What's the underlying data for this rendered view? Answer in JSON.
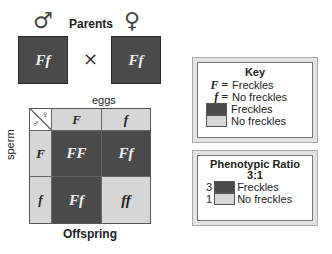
{
  "parents": {
    "title": "Parents",
    "male_symbol": "♂",
    "female_symbol": "♀",
    "male_genotype": "Ff",
    "female_genotype": "Ff",
    "cross_symbol": "×"
  },
  "punnett": {
    "top_label": "eggs",
    "side_label": "sperm",
    "bottom_label": "Offspring",
    "corner_male": "♂",
    "corner_female": "♀",
    "egg_alleles": [
      "F",
      "f"
    ],
    "sperm_alleles": [
      "F",
      "f"
    ],
    "cells": [
      [
        "FF",
        "Ff"
      ],
      [
        "Ff",
        "ff"
      ]
    ]
  },
  "key": {
    "title": "Key",
    "items": [
      {
        "symbol": "F =",
        "label": "Freckles"
      },
      {
        "symbol": "f =",
        "label": "No freckles"
      }
    ],
    "swatches": [
      {
        "color": "#4a4a4a",
        "label": "Freckles"
      },
      {
        "color": "#d6d6d6",
        "label": "No freckles"
      }
    ]
  },
  "ratio": {
    "title": "Phenotypic Ratio",
    "value": "3:1",
    "rows": [
      {
        "count": "3",
        "color": "#4a4a4a",
        "label": "Freckles"
      },
      {
        "count": "1",
        "color": "#d6d6d6",
        "label": "No freckles"
      }
    ]
  },
  "colors": {
    "dominant": "#4a4a4a",
    "recessive": "#d6d6d6"
  }
}
